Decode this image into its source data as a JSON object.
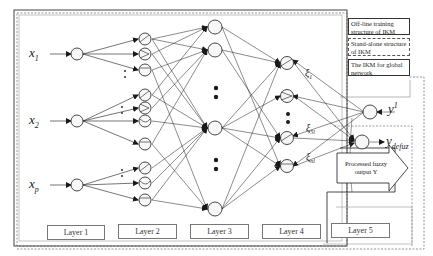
{
  "diagram": {
    "title": "",
    "colors": {
      "line": "#1a1a1a",
      "node_fill": "#f2f2f2",
      "border_gray": "#888888"
    },
    "inputs": [
      {
        "symbol": "x",
        "sub": "1"
      },
      {
        "symbol": "x",
        "sub": "2"
      },
      {
        "symbol": "x",
        "sub": "p"
      }
    ],
    "outputs": {
      "y1": {
        "symbol": "y",
        "sup": "1"
      },
      "ydefuz": {
        "symbol": "y",
        "sub": "defuz"
      }
    },
    "xi_labels": [
      {
        "symbol": "ξ",
        "sub": "1"
      },
      {
        "symbol": "ξ",
        "sub": "1"
      },
      {
        "symbol": "ξ",
        "sub": "5l"
      },
      {
        "symbol": "ξ",
        "sub": "nl"
      }
    ],
    "layers": [
      {
        "label": "Layer 1"
      },
      {
        "label": "Layer 2"
      },
      {
        "label": "Layer 3"
      },
      {
        "label": "Layer 4"
      },
      {
        "label": "Layer 5"
      }
    ],
    "legend": [
      {
        "text": "Off-line training structure of IKM",
        "style": "solid"
      },
      {
        "text": "Stand-alone structure of IKM",
        "style": "dashed"
      },
      {
        "text": "The IKM for global network",
        "style": "solid"
      }
    ],
    "processed_output": {
      "text": "Processed fuzzy output Y"
    }
  }
}
